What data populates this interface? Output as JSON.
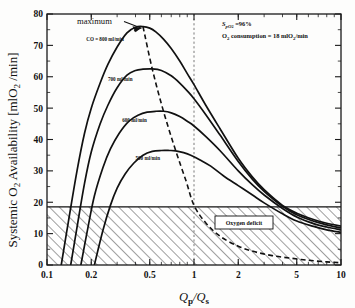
{
  "chart_data": {
    "type": "line",
    "title": "",
    "xlabel": "Qp/Qs",
    "ylabel": "Systemic O2 Availability [mlO2 /min]",
    "xscale": "log",
    "xlim": [
      0.1,
      10
    ],
    "ylim": [
      0,
      80
    ],
    "xticks": [
      "0.1",
      "0.2",
      "0.5",
      "1",
      "2",
      "5",
      "10"
    ],
    "xtick_values": [
      0.1,
      0.2,
      0.5,
      1,
      2,
      5,
      10
    ],
    "yticks": [
      "0",
      "10",
      "20",
      "30",
      "40",
      "50",
      "60",
      "70",
      "80"
    ],
    "ytick_values": [
      0,
      10,
      20,
      30,
      40,
      50,
      60,
      70,
      80
    ],
    "grid": false,
    "legend_position": "inline-curve-labels",
    "series": [
      {
        "name": "CO = 800 ml/min",
        "label": "CO = 800 ml/min",
        "peak_x": 0.45,
        "peak_y": 76,
        "zero_x": 0.125,
        "x": [
          0.125,
          0.14,
          0.16,
          0.18,
          0.2,
          0.23,
          0.26,
          0.3,
          0.35,
          0.4,
          0.45,
          0.5,
          0.55,
          0.62,
          0.7,
          0.8,
          0.9,
          1.0,
          1.2,
          1.5,
          2.0,
          2.5,
          3.0,
          4.0,
          5.0,
          6.5,
          8.0,
          10.0
        ],
        "y": [
          0,
          14,
          30,
          42,
          50,
          58,
          64,
          69.5,
          74,
          75.8,
          76,
          75.5,
          74.3,
          72,
          69,
          65,
          61,
          57.5,
          51,
          43.5,
          34,
          28,
          24,
          19,
          16.5,
          14.5,
          13.3,
          12.4
        ]
      },
      {
        "name": "700 ml/min",
        "label": "700 ml/min",
        "peak_x": 0.52,
        "peak_y": 62.5,
        "zero_x": 0.145,
        "x": [
          0.145,
          0.16,
          0.18,
          0.2,
          0.23,
          0.26,
          0.3,
          0.35,
          0.4,
          0.45,
          0.52,
          0.6,
          0.7,
          0.8,
          0.9,
          1.0,
          1.2,
          1.5,
          2.0,
          2.5,
          3.0,
          4.0,
          5.0,
          6.5,
          8.0,
          10.0
        ],
        "y": [
          0,
          12,
          26,
          36,
          45,
          51,
          56.5,
          60.5,
          62,
          62.4,
          62.5,
          62,
          60.3,
          58,
          55.5,
          53,
          48,
          41.5,
          33,
          27.3,
          23.5,
          18.7,
          16,
          14,
          12.8,
          11.8
        ]
      },
      {
        "name": "600 ml/min",
        "label": "600 ml/min",
        "peak_x": 0.62,
        "peak_y": 49,
        "zero_x": 0.17,
        "x": [
          0.17,
          0.19,
          0.21,
          0.24,
          0.27,
          0.31,
          0.36,
          0.42,
          0.48,
          0.55,
          0.62,
          0.7,
          0.8,
          0.9,
          1.0,
          1.2,
          1.5,
          2.0,
          2.5,
          3.0,
          4.0,
          5.0,
          6.5,
          8.0,
          10.0
        ],
        "y": [
          0,
          12,
          22,
          31,
          37,
          42,
          45.8,
          47.8,
          48.7,
          49,
          49,
          48.5,
          47.3,
          45.8,
          44.3,
          41,
          36.5,
          30,
          25.5,
          22.3,
          18,
          15.3,
          13.2,
          12.1,
          11.2
        ]
      },
      {
        "name": "500 ml/min",
        "label": "500 ml/min",
        "peak_x": 0.75,
        "peak_y": 36.5,
        "zero_x": 0.21,
        "x": [
          0.21,
          0.24,
          0.27,
          0.3,
          0.34,
          0.39,
          0.45,
          0.52,
          0.6,
          0.68,
          0.75,
          0.85,
          0.95,
          1.1,
          1.3,
          1.6,
          2.0,
          2.5,
          3.0,
          4.0,
          5.0,
          6.5,
          8.0,
          10.0
        ],
        "y": [
          0,
          11,
          19,
          24.5,
          29,
          32.5,
          35,
          36.2,
          36.5,
          36.5,
          36.4,
          35.8,
          35,
          33.5,
          31.5,
          28.3,
          25.3,
          22.3,
          19.8,
          16.3,
          14,
          12.3,
          11.2,
          10.4
        ]
      }
    ],
    "locus_curve": {
      "name": "maximum",
      "style": "dashed",
      "x": [
        0.45,
        0.52,
        0.62,
        0.75,
        0.88,
        1.0,
        1.2,
        1.5,
        2.0,
        2.6,
        3.4,
        4.5,
        6.0,
        8.0,
        10.0
      ],
      "y": [
        76,
        62.5,
        49,
        36.5,
        27,
        19,
        13.5,
        9.2,
        6.0,
        4.2,
        3.0,
        2.2,
        1.5,
        1.0,
        0.7
      ]
    },
    "shaded_region": {
      "label": "Oxygen deficit",
      "y_range": [
        0,
        18.5
      ],
      "hatch": "diagonal"
    },
    "annotations": [
      {
        "text": "maximum",
        "x": 0.3,
        "y": 79
      },
      {
        "text": "SpO2 =96%",
        "x": 1.5,
        "y": 78
      },
      {
        "text": "O2 consumption = 18 mlO2/min",
        "x": 1.5,
        "y": 74
      }
    ],
    "reference_line": {
      "x": 1,
      "style": "dotted",
      "color": "#7a7a7a"
    }
  },
  "labels": {
    "y_axis_pre": "Systemic O",
    "y_axis_sub": "2",
    "y_axis_post": " Availability [mlO",
    "y_axis_sub2": "2",
    "y_axis_end": " /min]",
    "x_axis_q": "Q",
    "x_axis_p": "p",
    "x_axis_slash": "/Q",
    "x_axis_s": "s",
    "maximum": "maximum",
    "co800": "CO = 800 ml/min",
    "co700": "700 ml/min",
    "co600": "600 ml/min",
    "co500": "500 ml/min",
    "spo2_s": "S",
    "spo2_sub": "pO",
    "spo2_sub2": "2",
    "spo2_val": " =96%",
    "consumption_o": "O",
    "consumption_sub": "2",
    "consumption_mid": " consumption = 18 mlO",
    "consumption_sub2": "2",
    "consumption_end": "/min",
    "oxygen_deficit": "Oxygen deficit",
    "xt0": "0.1",
    "xt1": "0.2",
    "xt2": "0.5",
    "xt3": "1",
    "xt4": "2",
    "xt5": "5",
    "xt6": "10",
    "yt0": "0",
    "yt1": "10",
    "yt2": "20",
    "yt3": "30",
    "yt4": "40",
    "yt5": "50",
    "yt6": "60",
    "yt7": "70",
    "yt8": "80"
  }
}
